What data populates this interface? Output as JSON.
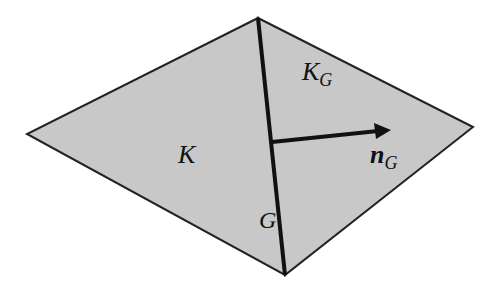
{
  "diagram": {
    "type": "two adjacent triangular elements sharing an edge",
    "colors": {
      "fill": "#c8c8c8",
      "outline": "#222222",
      "shared_edge": "#111111",
      "arrow": "#111111",
      "background": "#ffffff"
    },
    "labels": {
      "element_left": "K",
      "element_right_main": "K",
      "element_right_sub": "G",
      "edge_main": "G",
      "normal_main": "n",
      "normal_sub": "G"
    }
  }
}
